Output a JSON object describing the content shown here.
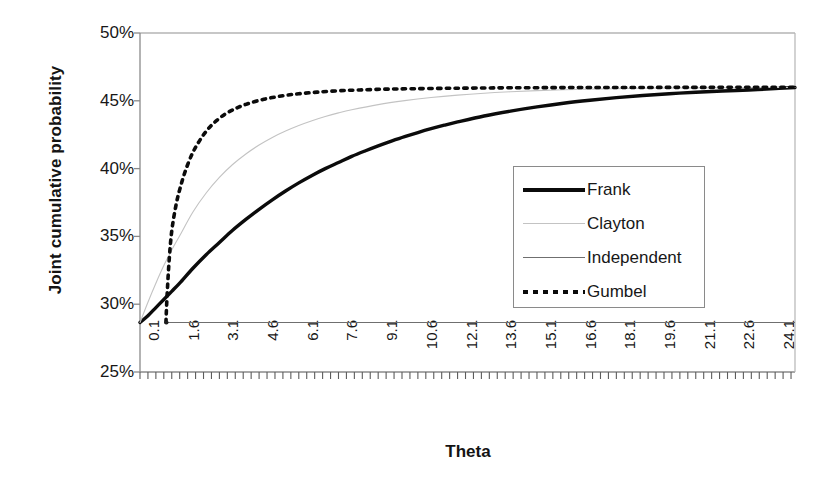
{
  "chart_data": {
    "type": "line",
    "title": "",
    "xlabel": "Theta",
    "ylabel": "Joint cumulative probability",
    "xlim": [
      0.1,
      24.85
    ],
    "ylim": [
      0.25,
      0.5
    ],
    "grid": false,
    "legend_position": "center-right",
    "y_tick_labels": [
      "50%",
      "45%",
      "40%",
      "35%",
      "30%",
      "25%"
    ],
    "y_tick_values": [
      0.5,
      0.45,
      0.4,
      0.35,
      0.3,
      0.25
    ],
    "x_tick_labels": [
      "0.1",
      "1.6",
      "3.1",
      "4.6",
      "6.1",
      "7.6",
      "9.1",
      "10.6",
      "12.1",
      "13.6",
      "15.1",
      "16.6",
      "18.1",
      "19.6",
      "21.1",
      "22.6",
      "24.1"
    ],
    "x_tick_values": [
      0.1,
      1.6,
      3.1,
      4.6,
      6.1,
      7.6,
      9.1,
      10.6,
      12.1,
      13.6,
      15.1,
      16.6,
      18.1,
      19.6,
      21.1,
      22.6,
      24.1
    ],
    "minor_ticks_per_label": 5,
    "series": [
      {
        "name": "Frank",
        "style": "solid-thick",
        "color": "#0b0b0b",
        "x": [
          0.1,
          0.4,
          0.7,
          1.0,
          1.3,
          1.6,
          2.1,
          2.6,
          3.1,
          3.6,
          4.1,
          4.6,
          5.1,
          5.6,
          6.1,
          6.6,
          7.1,
          7.6,
          8.1,
          8.6,
          9.1,
          9.6,
          10.1,
          10.6,
          11.1,
          11.6,
          12.1,
          13.1,
          14.1,
          15.1,
          16.1,
          17.1,
          18.1,
          19.1,
          20.1,
          21.1,
          22.1,
          23.1,
          24.1,
          24.85
        ],
        "y": [
          0.2865,
          0.2915,
          0.2975,
          0.3035,
          0.3095,
          0.3155,
          0.3265,
          0.3365,
          0.3455,
          0.3545,
          0.3625,
          0.37,
          0.377,
          0.3835,
          0.3895,
          0.395,
          0.4,
          0.4045,
          0.409,
          0.413,
          0.4168,
          0.4203,
          0.4236,
          0.4266,
          0.4294,
          0.432,
          0.4344,
          0.4388,
          0.4424,
          0.4455,
          0.4482,
          0.4504,
          0.4523,
          0.4539,
          0.4552,
          0.4563,
          0.4572,
          0.458,
          0.459,
          0.4598
        ]
      },
      {
        "name": "Clayton",
        "style": "solid-thin-light",
        "color": "#c3c3c3",
        "x": [
          0.1,
          0.4,
          0.7,
          1.0,
          1.3,
          1.6,
          2.1,
          2.6,
          3.1,
          3.6,
          4.1,
          4.6,
          5.1,
          5.6,
          6.1,
          6.6,
          7.1,
          7.6,
          8.1,
          9.1,
          10.1,
          11.1,
          12.1,
          13.1,
          14.1,
          15.1,
          16.1,
          17.1,
          18.1,
          19.1,
          20.1,
          21.1,
          22.1,
          23.1,
          24.1,
          24.85
        ],
        "y": [
          0.2865,
          0.3015,
          0.3155,
          0.3285,
          0.34,
          0.3505,
          0.368,
          0.382,
          0.3935,
          0.403,
          0.4108,
          0.4174,
          0.423,
          0.4277,
          0.4318,
          0.4353,
          0.4384,
          0.4411,
          0.4434,
          0.4472,
          0.4501,
          0.4524,
          0.4542,
          0.4556,
          0.4567,
          0.4575,
          0.4581,
          0.4586,
          0.4589,
          0.4592,
          0.4594,
          0.4595,
          0.4596,
          0.4597,
          0.4598,
          0.4598
        ]
      },
      {
        "name": "Independent",
        "style": "solid-thin",
        "color": "#6f6f6f",
        "x": [
          1.1,
          24.85
        ],
        "y": [
          0.2865,
          0.2865
        ]
      },
      {
        "name": "Gumbel",
        "style": "dotted",
        "color": "#0b0b0b",
        "x": [
          1.08,
          1.12,
          1.2,
          1.3,
          1.45,
          1.6,
          1.8,
          2.05,
          2.3,
          2.6,
          2.9,
          3.3,
          3.7,
          4.1,
          4.6,
          5.1,
          5.6,
          6.1,
          6.8,
          7.6,
          8.4,
          9.4,
          10.4,
          11.6,
          12.8,
          14.1,
          15.6,
          17.1,
          18.6,
          20.1,
          21.6,
          23.1,
          24.1,
          24.85
        ],
        "y": [
          0.2865,
          0.305,
          0.332,
          0.354,
          0.372,
          0.3845,
          0.3975,
          0.41,
          0.419,
          0.4275,
          0.4338,
          0.44,
          0.4442,
          0.4474,
          0.4503,
          0.4524,
          0.454,
          0.4552,
          0.4564,
          0.4574,
          0.458,
          0.4586,
          0.4589,
          0.4592,
          0.4594,
          0.4596,
          0.4597,
          0.4598,
          0.4598,
          0.4599,
          0.4599,
          0.46,
          0.46,
          0.46
        ]
      }
    ],
    "annotations": []
  },
  "legend": {
    "items": [
      {
        "label": "Frank",
        "icon": "thick-solid-line-icon"
      },
      {
        "label": "Clayton",
        "icon": "thin-light-line-icon"
      },
      {
        "label": "Independent",
        "icon": "thin-gray-line-icon"
      },
      {
        "label": "Gumbel",
        "icon": "dotted-line-icon"
      }
    ]
  },
  "colors": {
    "frank": "#0b0b0b",
    "clayton": "#c3c3c3",
    "independent": "#6f6f6f",
    "gumbel": "#0b0b0b",
    "axis": "#8a8a8a",
    "text": "#171717"
  }
}
